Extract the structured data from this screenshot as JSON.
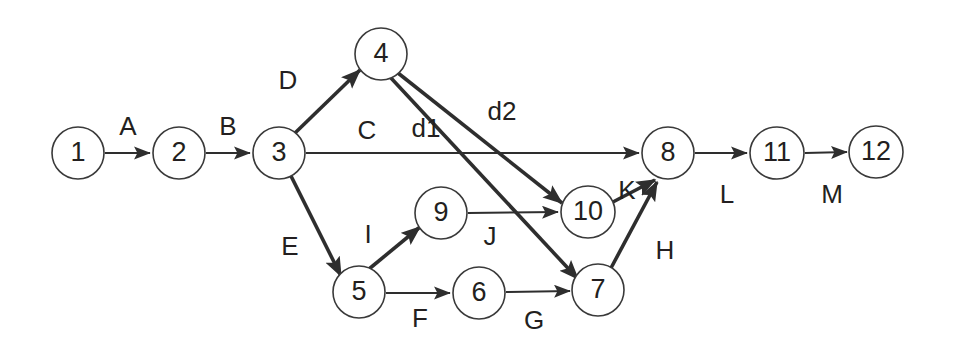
{
  "diagram": {
    "type": "activity-on-arrow-network",
    "canvas": {
      "width": 954,
      "height": 343,
      "background": "#ffffff"
    },
    "stroke_color": "#2e2e2e",
    "node_fill": "#ffffff",
    "node_stroke": "#3a3a3a",
    "nodes": [
      {
        "id": "1",
        "label": "1",
        "cx": 78,
        "cy": 153,
        "rx": 26,
        "ry": 26
      },
      {
        "id": "2",
        "label": "2",
        "cx": 179,
        "cy": 153,
        "rx": 26,
        "ry": 26
      },
      {
        "id": "3",
        "label": "3",
        "cx": 279,
        "cy": 153,
        "rx": 26,
        "ry": 26
      },
      {
        "id": "4",
        "label": "4",
        "cx": 381,
        "cy": 54,
        "rx": 26,
        "ry": 26
      },
      {
        "id": "5",
        "label": "5",
        "cx": 359,
        "cy": 292,
        "rx": 26,
        "ry": 26
      },
      {
        "id": "6",
        "label": "6",
        "cx": 479,
        "cy": 293,
        "rx": 26,
        "ry": 26
      },
      {
        "id": "7",
        "label": "7",
        "cx": 598,
        "cy": 290,
        "rx": 26,
        "ry": 26
      },
      {
        "id": "8",
        "label": "8",
        "cx": 668,
        "cy": 153,
        "rx": 26,
        "ry": 26
      },
      {
        "id": "9",
        "label": "9",
        "cx": 441,
        "cy": 213,
        "rx": 26,
        "ry": 26
      },
      {
        "id": "10",
        "label": "10",
        "cx": 588,
        "cy": 212,
        "rx": 27,
        "ry": 26
      },
      {
        "id": "11",
        "label": "11",
        "cx": 777,
        "cy": 153,
        "rx": 27,
        "ry": 26
      },
      {
        "id": "12",
        "label": "12",
        "cx": 876,
        "cy": 152,
        "rx": 27,
        "ry": 26
      }
    ],
    "edges": [
      {
        "id": "A",
        "label": "A",
        "from": "1",
        "to": "2",
        "weight": "thin",
        "x1": 105,
        "y1": 153,
        "x2": 150,
        "y2": 153,
        "label_x": 128,
        "label_y": 128
      },
      {
        "id": "B",
        "label": "B",
        "from": "2",
        "to": "3",
        "weight": "thin",
        "x1": 206,
        "y1": 153,
        "x2": 250,
        "y2": 153,
        "label_x": 228,
        "label_y": 128
      },
      {
        "id": "D",
        "label": "D",
        "from": "3",
        "to": "4",
        "weight": "thick",
        "x1": 295,
        "y1": 133,
        "x2": 360,
        "y2": 70,
        "label_x": 288,
        "label_y": 82
      },
      {
        "id": "E",
        "label": "E",
        "from": "3",
        "to": "5",
        "weight": "thick",
        "x1": 291,
        "y1": 176,
        "x2": 341,
        "y2": 276,
        "label_x": 290,
        "label_y": 248
      },
      {
        "id": "C",
        "label": "C",
        "from": "3",
        "to": "8",
        "weight": "thin",
        "x1": 306,
        "y1": 153,
        "x2": 639,
        "y2": 153,
        "label_x": 367,
        "label_y": 132
      },
      {
        "id": "d1",
        "label": "d1",
        "from": "4",
        "to": "7",
        "weight": "thick",
        "x1": 391,
        "y1": 78,
        "x2": 578,
        "y2": 279,
        "label_x": 426,
        "label_y": 130
      },
      {
        "id": "d2",
        "label": "d2",
        "from": "4",
        "to": "10",
        "weight": "thick",
        "x1": 398,
        "y1": 73,
        "x2": 562,
        "y2": 203,
        "label_x": 502,
        "label_y": 113
      },
      {
        "id": "I",
        "label": "I",
        "from": "5",
        "to": "9",
        "weight": "thick",
        "x1": 369,
        "y1": 269,
        "x2": 420,
        "y2": 227,
        "label_x": 368,
        "label_y": 236
      },
      {
        "id": "F",
        "label": "F",
        "from": "5",
        "to": "6",
        "weight": "thin",
        "x1": 386,
        "y1": 293,
        "x2": 450,
        "y2": 293,
        "label_x": 420,
        "label_y": 320
      },
      {
        "id": "J",
        "label": "J",
        "from": "9",
        "to": "10",
        "weight": "thin",
        "x1": 468,
        "y1": 213,
        "x2": 558,
        "y2": 212,
        "label_x": 490,
        "label_y": 238
      },
      {
        "id": "G",
        "label": "G",
        "from": "6",
        "to": "7",
        "weight": "thin",
        "x1": 506,
        "y1": 292,
        "x2": 570,
        "y2": 291,
        "label_x": 534,
        "label_y": 322
      },
      {
        "id": "K",
        "label": "K",
        "from": "10",
        "to": "8",
        "weight": "thick",
        "x1": 611,
        "y1": 203,
        "x2": 655,
        "y2": 180,
        "label_x": 627,
        "label_y": 192
      },
      {
        "id": "H",
        "label": "H",
        "from": "7",
        "to": "8",
        "weight": "thick",
        "x1": 611,
        "y1": 268,
        "x2": 657,
        "y2": 182,
        "label_x": 665,
        "label_y": 252
      },
      {
        "id": "L",
        "label": "L",
        "from": "8",
        "to": "11",
        "weight": "thin",
        "x1": 695,
        "y1": 153,
        "x2": 747,
        "y2": 153,
        "label_x": 727,
        "label_y": 196
      },
      {
        "id": "M",
        "label": "M",
        "from": "11",
        "to": "12",
        "weight": "thin",
        "x1": 805,
        "y1": 153,
        "x2": 847,
        "y2": 152,
        "label_x": 832,
        "label_y": 196
      }
    ]
  }
}
